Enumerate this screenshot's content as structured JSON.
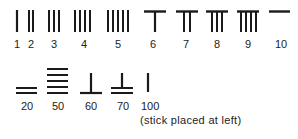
{
  "ink_color": "#1a1a1a",
  "top_row": [
    {
      "label": "1",
      "value": 1,
      "form": "vertical",
      "count": 1
    },
    {
      "label": "2",
      "value": 2,
      "form": "vertical",
      "count": 2
    },
    {
      "label": "3",
      "value": 3,
      "form": "vertical",
      "count": 3
    },
    {
      "label": "4",
      "value": 4,
      "form": "vertical",
      "count": 4
    },
    {
      "label": "5",
      "value": 5,
      "form": "vertical",
      "count": 5
    },
    {
      "label": "6",
      "value": 6,
      "form": "top-bar-with-verticals",
      "count": 1
    },
    {
      "label": "7",
      "value": 7,
      "form": "top-bar-with-verticals",
      "count": 2
    },
    {
      "label": "8",
      "value": 8,
      "form": "top-bar-with-verticals",
      "count": 3
    },
    {
      "label": "9",
      "value": 9,
      "form": "top-bar-with-verticals",
      "count": 4
    },
    {
      "label": "10",
      "value": 10,
      "form": "horizontal",
      "count": 1
    }
  ],
  "bottom_row": [
    {
      "label": "20",
      "value": 20,
      "form": "horizontal",
      "count": 2
    },
    {
      "label": "50",
      "value": 50,
      "form": "horizontal",
      "count": 5
    },
    {
      "label": "60",
      "value": 60,
      "form": "bottom-bar-with-vertical",
      "count": 1
    },
    {
      "label": "70",
      "value": 70,
      "form": "double-bottom-bar-with-vertical",
      "count": 2
    },
    {
      "label": "100",
      "value": 100,
      "form": "vertical",
      "count": 1
    }
  ],
  "caption": "(stick placed at left)"
}
